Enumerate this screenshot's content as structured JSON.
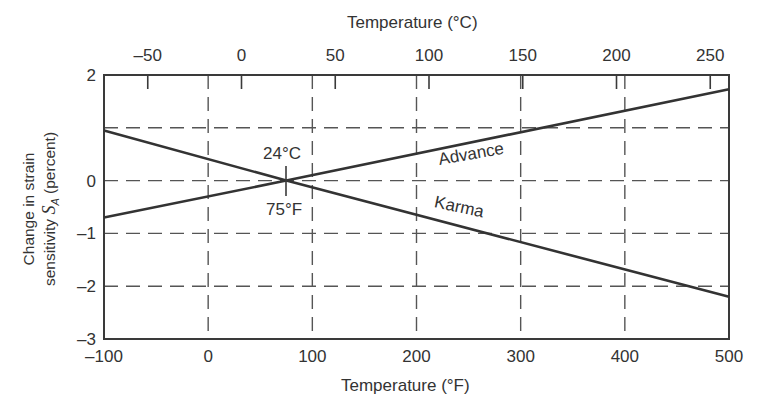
{
  "chart_data": {
    "type": "line",
    "title": "",
    "xlabel": "Temperature (°F)",
    "x2label": "Temperature (°C)",
    "ylabel_line1": "Change in strain",
    "ylabel_line2_prefix": "sensitivity ",
    "ylabel_symbol": "S",
    "ylabel_subscript": "A",
    "ylabel_suffix": "(percent)",
    "xlim": [
      -100,
      500
    ],
    "ylim": [
      -3,
      2
    ],
    "x_ticks": [
      -100,
      0,
      100,
      200,
      300,
      400,
      500
    ],
    "x_tick_labels": [
      "-100",
      "0",
      "100",
      "200",
      "300",
      "400",
      "500"
    ],
    "x2_ticks_celsius": [
      -50,
      0,
      50,
      100,
      150,
      200,
      250
    ],
    "x2_tick_labels": [
      "-50",
      "0",
      "50",
      "100",
      "150",
      "200",
      "250"
    ],
    "y_ticks": [
      2,
      0,
      -1,
      -2,
      -3
    ],
    "y_tick_labels": [
      "2",
      "0",
      "-1",
      "-2",
      "-3"
    ],
    "grid": {
      "style": "dashed",
      "x": [
        0,
        100,
        200,
        300,
        400
      ],
      "y": [
        1,
        0,
        -1,
        -2
      ]
    },
    "series": [
      {
        "name": "Advance",
        "x": [
          -100,
          75,
          500
        ],
        "y": [
          -0.7,
          0.0,
          1.73
        ]
      },
      {
        "name": "Karma",
        "x": [
          -100,
          75,
          500
        ],
        "y": [
          0.95,
          0.0,
          -2.2
        ]
      }
    ],
    "annotations": [
      {
        "text": "24°C",
        "x": 75,
        "y": 0,
        "position": "above"
      },
      {
        "text": "75°F",
        "x": 75,
        "y": 0,
        "position": "below"
      }
    ],
    "legend": "inline labels on lines"
  },
  "labels": {
    "advance": "Advance",
    "karma": "Karma",
    "cross_c": "24°C",
    "cross_f": "75°F"
  }
}
